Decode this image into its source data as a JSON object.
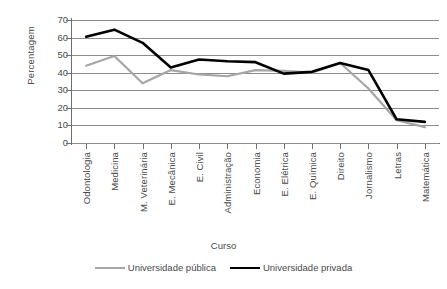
{
  "chart_data": {
    "type": "line",
    "title": "",
    "xlabel": "Curso",
    "ylabel": "Percentagem",
    "ylim": [
      0,
      70
    ],
    "ytick_values": [
      70,
      60,
      50,
      40,
      30,
      20,
      10,
      0
    ],
    "yticks": [
      "70",
      "60",
      "50",
      "40",
      "30",
      "20",
      "10",
      "0"
    ],
    "grid": true,
    "legend_position": "bottom",
    "categories": [
      "Odontologia",
      "Medicina",
      "M. Veterinária",
      "E. Mecânica",
      "E. Civil",
      "Administração",
      "Economia",
      "E. Elétrica",
      "E. Química",
      "Direito",
      "Jornalismo",
      "Letras",
      "Matemática"
    ],
    "series": [
      {
        "name": "Universidade pública",
        "color": "#a6a6a6",
        "line_width": 2.2,
        "values": [
          44,
          49.5,
          34,
          41.5,
          39,
          38,
          41.5,
          41,
          40,
          45.5,
          31,
          13,
          9
        ]
      },
      {
        "name": "Universidade privada",
        "color": "#000000",
        "line_width": 2.6,
        "values": [
          60.5,
          64.5,
          57,
          43,
          47.5,
          46.5,
          46,
          39.5,
          40.5,
          45.5,
          41.5,
          13.5,
          12
        ]
      }
    ]
  },
  "legend": {
    "entries": [
      {
        "label": "Universidade pública"
      },
      {
        "label": "Universidade privada"
      }
    ]
  }
}
